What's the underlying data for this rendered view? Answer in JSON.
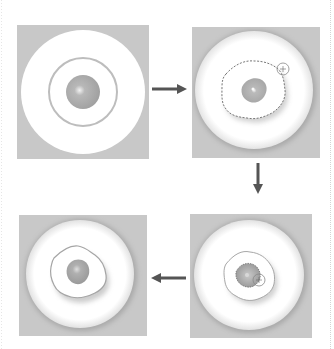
{
  "diagram": {
    "colors": {
      "background": "#ffffff",
      "panel_bg": "#c7c7c7",
      "disc": "#ffffff",
      "ring": "#bdbdbd",
      "core": "#a9a9a9",
      "core_highlight": "#eeeeee",
      "selection_outline": "#7a7a7a",
      "arrow": "#555555"
    },
    "steps": [
      {
        "id": 1,
        "label": "Original: concentric disc with ring and core",
        "position": "top-left"
      },
      {
        "id": 2,
        "label": "Outer lasso selection drawn around core",
        "position": "top-right",
        "cursor": "lasso-cursor"
      },
      {
        "id": 3,
        "label": "Inner selection traced around core",
        "position": "bottom-right",
        "cursor": "lasso-cursor"
      },
      {
        "id": 4,
        "label": "Result: embossed selection",
        "position": "bottom-left"
      }
    ],
    "arrows": [
      {
        "from": 1,
        "to": 2,
        "direction": "right"
      },
      {
        "from": 2,
        "to": 3,
        "direction": "down"
      },
      {
        "from": 3,
        "to": 4,
        "direction": "left"
      }
    ]
  }
}
